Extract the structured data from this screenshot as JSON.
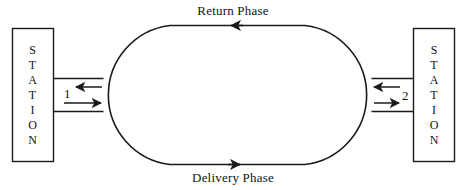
{
  "diagram": {
    "type": "loop-track-schematic",
    "title": "",
    "stroke_color": "#1a1a1a",
    "background_color": "#ffffff",
    "stations": [
      {
        "id": "station-left",
        "label": "STATION",
        "letters": [
          "S",
          "T",
          "A",
          "T",
          "I",
          "O",
          "N"
        ],
        "side": "left",
        "port_label": "1"
      },
      {
        "id": "station-right",
        "label": "STATION",
        "letters": [
          "S",
          "T",
          "A",
          "T",
          "I",
          "O",
          "N"
        ],
        "side": "right",
        "port_label": "2"
      }
    ],
    "phases": [
      {
        "id": "return-phase",
        "label": "Return Phase",
        "position": "top",
        "direction": "leftward"
      },
      {
        "id": "delivery-phase",
        "label": "Delivery Phase",
        "position": "bottom",
        "direction": "rightward"
      }
    ],
    "ports": [
      {
        "id": "port-1",
        "label": "1",
        "station": "station-left",
        "inbound_direction": "leftward",
        "outbound_direction": "rightward"
      },
      {
        "id": "port-2",
        "label": "2",
        "station": "station-right",
        "inbound_direction": "rightward",
        "outbound_direction": "leftward"
      }
    ]
  }
}
